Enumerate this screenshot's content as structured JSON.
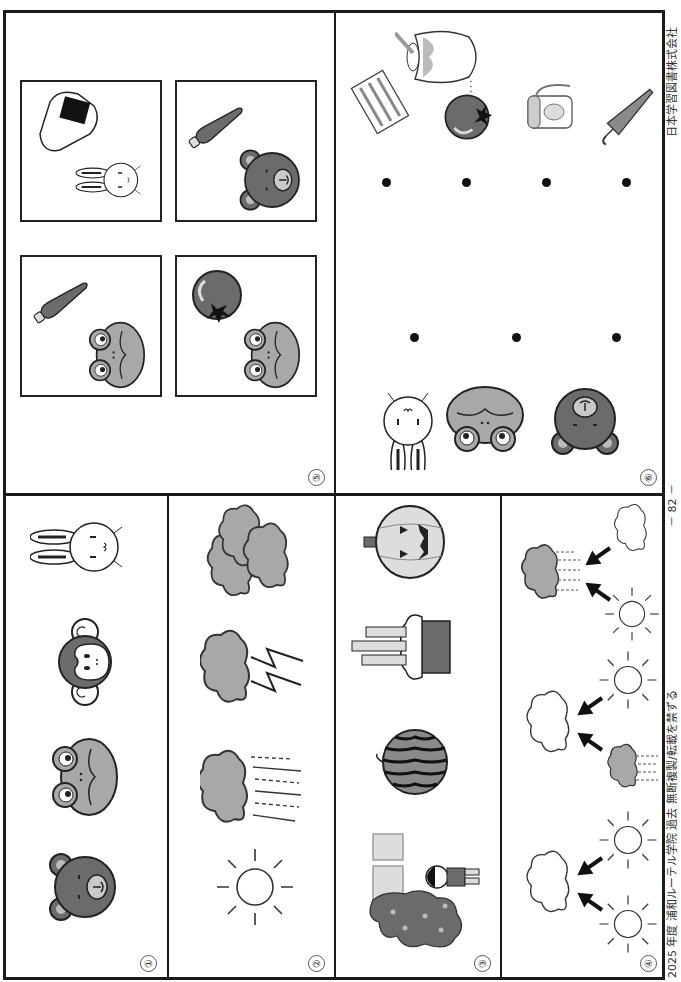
{
  "page": {
    "orientation": "landscape, rotated 90° counter-clockwise",
    "footer_left": "2025 年度  浦和ルーテル学院  過去  無断複製/転載を禁ずる",
    "page_number": "－ 82 －",
    "footer_right": "日本学習図書株式会社"
  },
  "sections": [
    {
      "marker": "①",
      "name": "animals-row",
      "items": [
        "bear",
        "frog",
        "monkey",
        "rabbit"
      ]
    },
    {
      "marker": "②",
      "name": "weather-row",
      "items": [
        "sun",
        "rain-cloud",
        "thunder-cloud",
        "clouds"
      ]
    },
    {
      "marker": "③",
      "name": "seasons-row",
      "items": [
        "cherry-blossom-school-entrance",
        "watermelon",
        "kadomatsu",
        "jack-o-lantern-pumpkin"
      ]
    },
    {
      "marker": "④",
      "name": "weather-change-row",
      "groups": [
        {
          "top": "cloud",
          "bottom_left": "sun",
          "bottom_right": "sun"
        },
        {
          "top": "cloud",
          "bottom_left": "rain-cloud",
          "bottom_right": "sun"
        },
        {
          "top": "rain-cloud",
          "bottom_left": "sun",
          "bottom_right": "cloud"
        }
      ]
    },
    {
      "marker": "⑤",
      "name": "pair-boxes",
      "boxes": [
        {
          "animal": "frog",
          "object": "carrot"
        },
        {
          "animal": "rabbit",
          "object": "rice-ball"
        },
        {
          "animal": "frog",
          "object": "tomato"
        },
        {
          "animal": "bear",
          "object": "carrot"
        }
      ]
    },
    {
      "marker": "⑥",
      "name": "matching",
      "left": [
        "rabbit",
        "frog",
        "bear"
      ],
      "right": [
        "towel",
        "tomato",
        "water-bottle",
        "umbrella"
      ],
      "extra": [
        "honey-pot"
      ]
    }
  ],
  "colors": {
    "ink": "#1a1a1a",
    "gray_dark": "#6b6b6b",
    "gray_mid": "#8a8a8a",
    "gray_light": "#bdbdbd",
    "paper": "#ffffff"
  }
}
